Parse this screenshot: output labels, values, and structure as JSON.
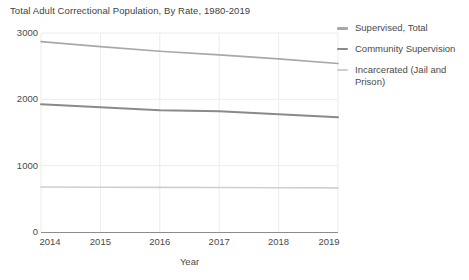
{
  "chart_data": {
    "type": "line",
    "title": "Total Adult Correctional Population, By Rate, 1980-2019",
    "xlabel": "Year",
    "ylabel": "",
    "x": [
      2014,
      2015,
      2016,
      2017,
      2018,
      2019
    ],
    "xlim": [
      2014,
      2019
    ],
    "ylim": [
      0,
      3000
    ],
    "yticks": [
      0,
      1000,
      2000,
      3000
    ],
    "xticks": [
      2014,
      2015,
      2016,
      2017,
      2018,
      2019
    ],
    "grid": true,
    "legend_position": "right",
    "series": [
      {
        "name": "Supervised, Total",
        "color": "#a8a8a8",
        "values": [
          2870,
          2795,
          2725,
          2670,
          2610,
          2540
        ]
      },
      {
        "name": "Community Supervision",
        "color": "#8a8a8a",
        "values": [
          1925,
          1880,
          1835,
          1820,
          1775,
          1730
        ]
      },
      {
        "name": "Incarcerated (Jail and Prison)",
        "color": "#cfcfcf",
        "values": [
          678,
          675,
          672,
          670,
          668,
          665
        ]
      }
    ]
  },
  "axis": {
    "y_ticks": [
      "3000",
      "2000",
      "1000",
      "0"
    ],
    "x_ticks": [
      "2014",
      "2015",
      "2016",
      "2017",
      "2018",
      "2019"
    ],
    "x_title": "Year"
  },
  "legend": {
    "items": [
      {
        "label": "Supervised, Total",
        "color": "#a8a8a8"
      },
      {
        "label": "Community Supervision",
        "color": "#8a8a8a"
      },
      {
        "label": "Incarcerated (Jail and Prison)",
        "color": "#cfcfcf"
      }
    ]
  },
  "colors": {
    "grid": "#ececec",
    "axis": "#8c8c8c",
    "text": "#4a4a4a",
    "background": "#ffffff"
  }
}
